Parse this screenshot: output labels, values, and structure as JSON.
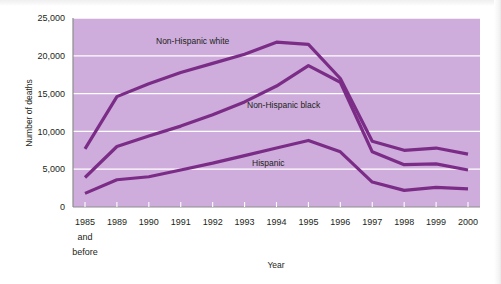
{
  "figure": {
    "name": "deaths-by-race-ethnicity-line-chart",
    "background_color": "#ffffff",
    "plot_background_color": "#ceaddc",
    "series_color": "#7b2c86",
    "gridline_color": "#ffffff",
    "axis_color": "#8d8d8d"
  },
  "chart_data": {
    "type": "line",
    "title": "",
    "xlabel": "Year",
    "ylabel": "Number of deaths",
    "categories": [
      "1985\nand\nbefore",
      "1989",
      "1990",
      "1991",
      "1992",
      "1993",
      "1994",
      "1995",
      "1996",
      "1997",
      "1998",
      "1999",
      "2000"
    ],
    "x_tick_labels": [
      "1985",
      "1989",
      "1990",
      "1991",
      "1992",
      "1993",
      "1994",
      "1995",
      "1996",
      "1997",
      "1998",
      "1999",
      "2000"
    ],
    "x_first_tick_extra_lines": [
      "and",
      "before"
    ],
    "y_tick_labels": [
      "0",
      "5,000",
      "10,000",
      "15,000",
      "20,000",
      "25,000"
    ],
    "y_tick_values": [
      0,
      5000,
      10000,
      15000,
      20000,
      25000
    ],
    "ylim": [
      0,
      25000
    ],
    "grid": true,
    "legend_position": "inline-annotations",
    "series": [
      {
        "name": "Non-Hispanic white",
        "label": "Non-Hispanic white",
        "color": "#7b2c86",
        "values": [
          7700,
          14600,
          16300,
          17800,
          19000,
          20200,
          21800,
          21500,
          17000,
          8700,
          7500,
          7800,
          7000
        ]
      },
      {
        "name": "Non-Hispanic black",
        "label": "Non-Hispanic black",
        "color": "#7b2c86",
        "values": [
          3900,
          8000,
          9400,
          10700,
          12200,
          13900,
          16000,
          18700,
          16500,
          7300,
          5600,
          5700,
          4900
        ]
      },
      {
        "name": "Hispanic",
        "label": "Hispanic",
        "color": "#7b2c86",
        "values": [
          1800,
          3600,
          4000,
          4900,
          5800,
          6800,
          7800,
          8800,
          7300,
          3300,
          2200,
          2600,
          2400
        ]
      }
    ],
    "annotations": [
      {
        "text": "Non-Hispanic white",
        "series": "Non-Hispanic white",
        "x_px": 156,
        "y_px": 44
      },
      {
        "text": "Non-Hispanic black",
        "series": "Non-Hispanic black",
        "x_px": 247,
        "y_px": 108
      },
      {
        "text": "Hispanic",
        "series": "Hispanic",
        "x_px": 252,
        "y_px": 166
      }
    ]
  }
}
